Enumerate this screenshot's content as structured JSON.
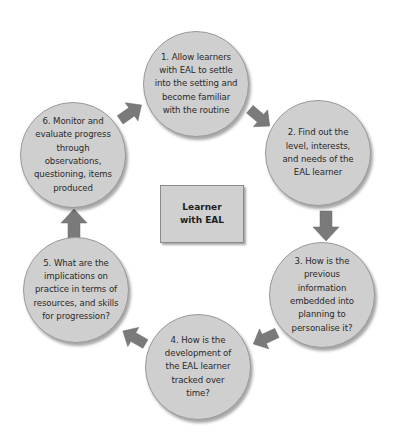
{
  "diagram": {
    "center": {
      "label": "Learner\nwith EAL"
    },
    "steps": [
      {
        "label": "1. Allow learners with EAL to settle into the setting and become familiar with the routine"
      },
      {
        "label": "2. Find out the level, interests, and needs of the EAL learner"
      },
      {
        "label": "3. How is the previous information embedded into planning to personalise it?"
      },
      {
        "label": "4. How is the development of the EAL learner tracked over time?"
      },
      {
        "label": "5. What are the implications on practice in terms of resources, and skills for progression?"
      },
      {
        "label": "6. Monitor and evaluate progress through observations, questioning, items produced"
      }
    ],
    "arrows": [
      {
        "from": 1,
        "to": 2
      },
      {
        "from": 2,
        "to": 3
      },
      {
        "from": 3,
        "to": 4
      },
      {
        "from": 4,
        "to": 5
      },
      {
        "from": 5,
        "to": 6
      },
      {
        "from": 6,
        "to": 1
      }
    ],
    "colors": {
      "circle_fill": "#cfcfcf",
      "arrow_fill": "#7a7a7a",
      "box_fill": "#d0d0d0"
    }
  }
}
